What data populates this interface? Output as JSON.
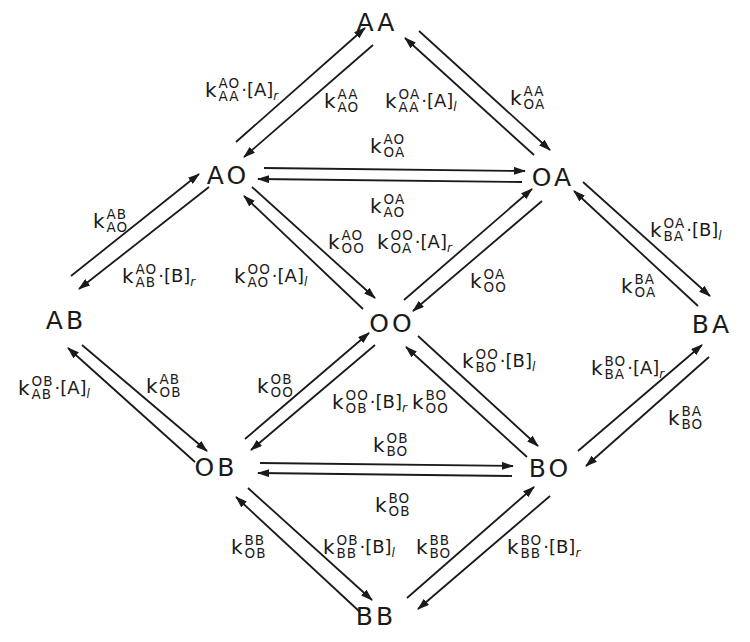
{
  "diagram": {
    "title": "",
    "type": "kinetic state scheme",
    "nodes": [
      {
        "id": "AA",
        "label": "AA",
        "x": 377,
        "y": 22
      },
      {
        "id": "AO",
        "label": "AO",
        "x": 228,
        "y": 175
      },
      {
        "id": "OA",
        "label": "OA",
        "x": 553,
        "y": 177
      },
      {
        "id": "AB",
        "label": "AB",
        "x": 66,
        "y": 320
      },
      {
        "id": "OO",
        "label": "OO",
        "x": 392,
        "y": 323
      },
      {
        "id": "BA",
        "label": "BA",
        "x": 712,
        "y": 324
      },
      {
        "id": "OB",
        "label": "OB",
        "x": 216,
        "y": 467
      },
      {
        "id": "BO",
        "label": "BO",
        "x": 550,
        "y": 468
      },
      {
        "id": "BB",
        "label": "BB",
        "x": 376,
        "y": 616
      }
    ],
    "labels": {
      "aa_from_ao": {
        "sup": "AO",
        "sub": "AA",
        "conc": "·[A]",
        "csub": "r"
      },
      "ao_from_aa": {
        "sup": "AA",
        "sub": "AO",
        "conc": "",
        "csub": ""
      },
      "aa_from_oa": {
        "sup": "OA",
        "sub": "AA",
        "conc": "·[A]",
        "csub": "l"
      },
      "oa_from_aa": {
        "sup": "AA",
        "sub": "OA",
        "conc": "",
        "csub": ""
      },
      "oa_from_ao": {
        "sup": "AO",
        "sub": "OA",
        "conc": "",
        "csub": ""
      },
      "ao_from_oa": {
        "sup": "OA",
        "sub": "AO",
        "conc": "",
        "csub": ""
      },
      "ao_from_ab": {
        "sup": "AB",
        "sub": "AO",
        "conc": "",
        "csub": ""
      },
      "ab_from_ao": {
        "sup": "AO",
        "sub": "AB",
        "conc": "·[B]",
        "csub": "r"
      },
      "oo_from_ao": {
        "sup": "AO",
        "sub": "OO",
        "conc": "",
        "csub": ""
      },
      "ao_from_oo": {
        "sup": "OO",
        "sub": "AO",
        "conc": "·[A]",
        "csub": "l"
      },
      "oa_from_oo": {
        "sup": "OO",
        "sub": "OA",
        "conc": "·[A]",
        "csub": "r"
      },
      "oo_from_oa": {
        "sup": "OA",
        "sub": "OO",
        "conc": "",
        "csub": ""
      },
      "ba_from_oa": {
        "sup": "OA",
        "sub": "BA",
        "conc": "·[B]",
        "csub": "l"
      },
      "oa_from_ba": {
        "sup": "BA",
        "sub": "OA",
        "conc": "",
        "csub": ""
      },
      "ab_from_ob": {
        "sup": "OB",
        "sub": "AB",
        "conc": "·[A]",
        "csub": "l"
      },
      "ob_from_ab": {
        "sup": "AB",
        "sub": "OB",
        "conc": "",
        "csub": ""
      },
      "oo_from_ob": {
        "sup": "OB",
        "sub": "OO",
        "conc": "",
        "csub": ""
      },
      "ob_from_oo": {
        "sup": "OO",
        "sub": "OB",
        "conc": "·[B]",
        "csub": "r"
      },
      "oo_from_bo": {
        "sup": "BO",
        "sub": "OO",
        "conc": "",
        "csub": ""
      },
      "bo_from_oo": {
        "sup": "OO",
        "sub": "BO",
        "conc": "·[B]",
        "csub": "l"
      },
      "ba_from_bo": {
        "sup": "BO",
        "sub": "BA",
        "conc": "·[A]",
        "csub": "r"
      },
      "bo_from_ba": {
        "sup": "BA",
        "sub": "BO",
        "conc": "",
        "csub": ""
      },
      "bo_from_ob": {
        "sup": "OB",
        "sub": "BO",
        "conc": "",
        "csub": ""
      },
      "ob_from_bo": {
        "sup": "BO",
        "sub": "OB",
        "conc": "",
        "csub": ""
      },
      "ob_from_bb": {
        "sup": "BB",
        "sub": "OB",
        "conc": "",
        "csub": ""
      },
      "bb_from_ob": {
        "sup": "OB",
        "sub": "BB",
        "conc": "·[B]",
        "csub": "l"
      },
      "bo_from_bb": {
        "sup": "BB",
        "sub": "BO",
        "conc": "",
        "csub": ""
      },
      "bb_from_bo": {
        "sup": "BO",
        "sub": "BB",
        "conc": "·[B]",
        "csub": "r"
      }
    },
    "k_symbol": "k",
    "colors": {
      "ink": "#1a1a1a",
      "background": "#ffffff"
    }
  }
}
